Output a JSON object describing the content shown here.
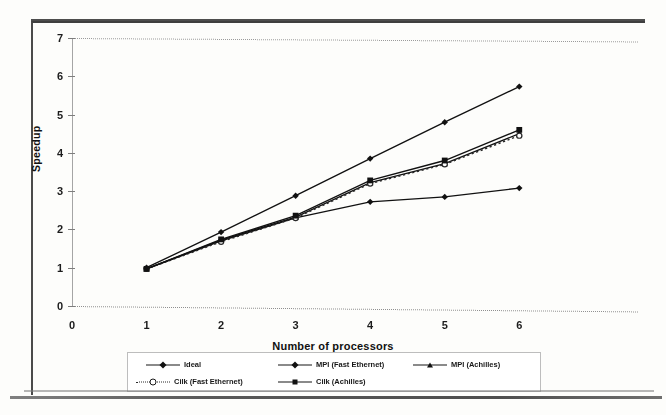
{
  "chart_data": {
    "type": "line",
    "title": "",
    "subtitle": "",
    "xlabel": "Number of processors",
    "ylabel": "Speedup",
    "x": [
      1,
      2,
      3,
      4,
      5,
      6
    ],
    "xlim": [
      0,
      6.6
    ],
    "ylim": [
      0,
      7
    ],
    "xticks": [
      "0",
      "1",
      "2",
      "3",
      "4",
      "5",
      "6"
    ],
    "yticks": [
      "0",
      "1",
      "2",
      "3",
      "4",
      "5",
      "6",
      "7"
    ],
    "grid": false,
    "legend_position": "bottom",
    "series": [
      {
        "name": "Ideal",
        "marker": "diamond",
        "line": "solid",
        "color": "#111111",
        "values": [
          1.0,
          1.93,
          2.88,
          3.85,
          4.8,
          5.73
        ]
      },
      {
        "name": "MPI (Fast Ethernet)",
        "marker": "diamond",
        "line": "solid",
        "color": "#111111",
        "values": [
          0.97,
          1.7,
          2.3,
          2.72,
          2.85,
          3.08
        ]
      },
      {
        "name": "MPI (Achilles)",
        "marker": "triangle",
        "line": "solid",
        "color": "#111111",
        "values": [
          0.97,
          1.72,
          2.32,
          3.22,
          3.72,
          4.5
        ]
      },
      {
        "name": "Cilk (Fast Ethernet)",
        "marker": "circle",
        "line": "dotted",
        "color": "#2a2a2a",
        "values": [
          0.97,
          1.68,
          2.3,
          3.2,
          3.7,
          4.45
        ]
      },
      {
        "name": "Cilk (Achilles)",
        "marker": "square",
        "line": "solid",
        "color": "#111111",
        "values": [
          0.97,
          1.74,
          2.36,
          3.28,
          3.8,
          4.6
        ]
      }
    ]
  },
  "axes": {
    "y_title": "Speedup",
    "x_title": "Number of processors"
  }
}
